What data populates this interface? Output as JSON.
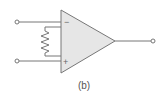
{
  "figure": {
    "caption": "(b)",
    "colors": {
      "stroke": "#777777",
      "fill": "#e6e6e6",
      "terminal_fill": "#ffffff",
      "text": "#555555"
    },
    "opamp": {
      "inverting_label": "−",
      "noninverting_label": "+"
    },
    "terminals": [
      {
        "name": "inverting-input-terminal"
      },
      {
        "name": "noninverting-input-terminal"
      },
      {
        "name": "output-terminal"
      }
    ]
  }
}
